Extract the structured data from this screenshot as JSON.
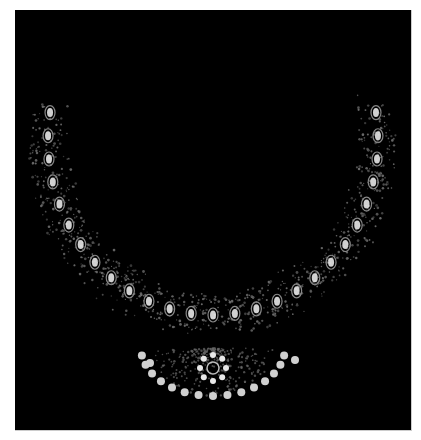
{
  "image": {
    "subject": "Gold and diamond necklace with pendant on black background",
    "alt": "necklace"
  },
  "colors": {
    "background": "#000000",
    "border": "#ffffff",
    "metal": "#6a6a6a",
    "stone": "#e8e8e8",
    "pearl": "#d0d0d0"
  }
}
